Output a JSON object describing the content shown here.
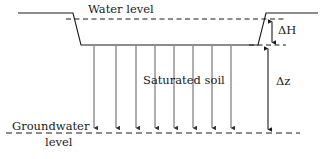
{
  "figure": {
    "width": 328,
    "height": 159,
    "background": "#ffffff",
    "stroke_color": "#1a1a1a",
    "arrow_color": "#555555"
  },
  "labels": {
    "water_level": "Water level",
    "saturated_soil": "Saturated soil",
    "groundwater_line1": "Groundwater",
    "groundwater_line2": "level",
    "delta_h": "ΔH",
    "delta_z": "Δz"
  },
  "geometry": {
    "ground_surface_left": {
      "x1": 18,
      "y1": 13,
      "x2": 73,
      "y2": 13
    },
    "ground_slope_left": {
      "x1": 73,
      "y1": 13,
      "x2": 81,
      "y2": 45
    },
    "excavation_base": {
      "x1": 81,
      "y1": 45,
      "x2": 258,
      "y2": 45
    },
    "ground_slope_right": {
      "x1": 258,
      "y1": 45,
      "x2": 266,
      "y2": 13
    },
    "ground_surface_right": {
      "x1": 266,
      "y1": 13,
      "x2": 318,
      "y2": 13
    },
    "water_level_dashed": {
      "x1": 66,
      "y1": 19,
      "x2": 286,
      "y2": 19
    },
    "excavation_base_dashed": {
      "x1": 249,
      "y1": 45,
      "x2": 286,
      "y2": 45
    },
    "groundwater_dashed": {
      "x1": 6,
      "y1": 133,
      "x2": 300,
      "y2": 133
    },
    "delta_h_arrow": {
      "x": 272,
      "y_top": 19,
      "y_bottom": 45
    },
    "delta_z_arrow": {
      "x": 268,
      "y_top": 46,
      "y_bottom": 132
    }
  },
  "seepage_arrows": {
    "count": 8,
    "y_top": 46,
    "y_bottom": 132,
    "x_positions": [
      94,
      116,
      136,
      155,
      174,
      193,
      212,
      231
    ]
  }
}
